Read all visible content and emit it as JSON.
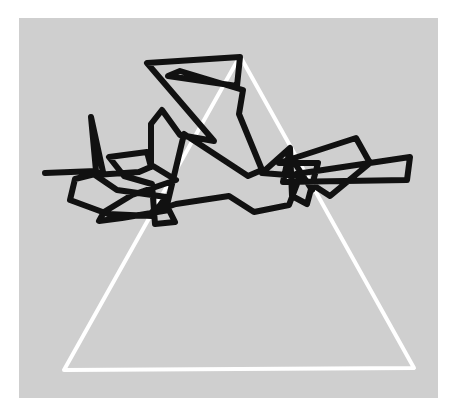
{
  "figure": {
    "title": "Polyline path over triangle outline",
    "type": "line-drawing",
    "width": 456,
    "height": 416,
    "background_color": "#ffffff",
    "panel": {
      "name": "gray-panel",
      "fill_color": "#cfcfcf",
      "x": 19,
      "y": 18,
      "width": 419,
      "height": 380
    },
    "triangle": {
      "name": "white-triangle",
      "stroke_color": "#ffffff",
      "stroke_width": 4,
      "closed": true,
      "vertices": [
        [
          240,
          56
        ],
        [
          414,
          368
        ],
        [
          64,
          370
        ]
      ]
    },
    "polyline": {
      "name": "black-polyline",
      "stroke_color": "#111111",
      "stroke_width": 6,
      "closed": false,
      "point_count": 62,
      "points": [
        [
          45,
          173
        ],
        [
          96,
          171
        ],
        [
          91,
          117
        ],
        [
          103,
          172
        ],
        [
          75,
          179
        ],
        [
          70,
          200
        ],
        [
          108,
          214
        ],
        [
          152,
          216
        ],
        [
          166,
          197
        ],
        [
          117,
          190
        ],
        [
          95,
          175
        ],
        [
          139,
          172
        ],
        [
          153,
          166
        ],
        [
          176,
          180
        ],
        [
          132,
          195
        ],
        [
          104,
          212
        ],
        [
          99,
          221
        ],
        [
          122,
          218
        ],
        [
          169,
          210
        ],
        [
          175,
          222
        ],
        [
          155,
          224
        ],
        [
          152,
          184
        ],
        [
          124,
          176
        ],
        [
          109,
          157
        ],
        [
          147,
          152
        ],
        [
          151,
          167
        ],
        [
          151,
          124
        ],
        [
          162,
          110
        ],
        [
          180,
          135
        ],
        [
          214,
          141
        ],
        [
          147,
          63
        ],
        [
          240,
          57
        ],
        [
          237,
          86
        ],
        [
          168,
          76
        ],
        [
          180,
          71
        ],
        [
          243,
          90
        ],
        [
          239,
          114
        ],
        [
          262,
          170
        ],
        [
          248,
          176
        ],
        [
          184,
          134
        ],
        [
          168,
          201
        ],
        [
          152,
          212
        ],
        [
          176,
          204
        ],
        [
          229,
          196
        ],
        [
          254,
          212
        ],
        [
          289,
          205
        ],
        [
          300,
          176
        ],
        [
          262,
          173
        ],
        [
          290,
          148
        ],
        [
          292,
          196
        ],
        [
          307,
          204
        ],
        [
          318,
          163
        ],
        [
          279,
          163
        ],
        [
          356,
          138
        ],
        [
          370,
          163
        ],
        [
          330,
          196
        ],
        [
          296,
          174
        ],
        [
          410,
          157
        ],
        [
          407,
          180
        ],
        [
          283,
          182
        ],
        [
          289,
          154
        ],
        [
          312,
          190
        ]
      ]
    }
  }
}
